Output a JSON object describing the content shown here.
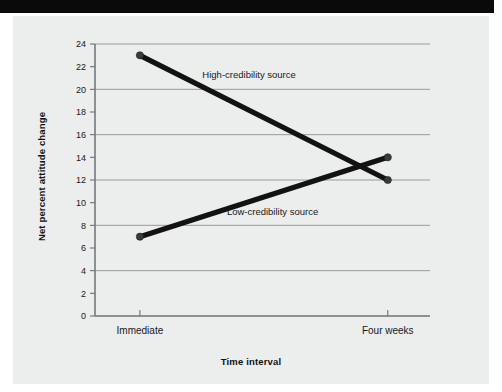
{
  "figure": {
    "background_color": "#eceded",
    "banner_color": "#0a0a0a",
    "line_color": "#121212",
    "grid_color": "#8e9193"
  },
  "chart_data": {
    "type": "line",
    "title": "",
    "subtitle": "",
    "xlabel": "Time interval",
    "ylabel": "Net percent attitude change",
    "categories": [
      "Immediate",
      "Four weeks"
    ],
    "ylim": [
      0,
      24
    ],
    "ytick_step": 2,
    "gridline_step": 4,
    "grid": true,
    "legend_position": "inline-annotation",
    "ytick_labels": [
      "0",
      "2",
      "4",
      "6",
      "8",
      "10",
      "12",
      "14",
      "16",
      "18",
      "20",
      "22",
      "24"
    ],
    "gridline_values": [
      0,
      4,
      8,
      12,
      16,
      20,
      24
    ],
    "series": [
      {
        "name": "High-credibility source",
        "values": [
          23,
          12
        ],
        "annotation": "High-credibility source",
        "annotation_at": {
          "x": 0.46,
          "y": 21.0
        }
      },
      {
        "name": "Low-credibility source",
        "values": [
          7,
          14
        ],
        "annotation": "Low-credibility source",
        "annotation_at": {
          "x": 0.53,
          "y": 8.9
        }
      }
    ],
    "annotations": [
      {
        "text": "High-credibility source"
      },
      {
        "text": "Low-credibility source"
      }
    ]
  }
}
